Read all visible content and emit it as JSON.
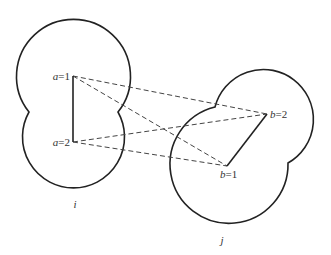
{
  "diagram": {
    "bodies": [
      {
        "id": "i",
        "label": "i",
        "sites": [
          {
            "var": "a",
            "value": "1",
            "text": "=1"
          },
          {
            "var": "a",
            "value": "2",
            "text": "=2"
          }
        ]
      },
      {
        "id": "j",
        "label": "j",
        "sites": [
          {
            "var": "b",
            "value": "1",
            "text": "=1"
          },
          {
            "var": "b",
            "value": "2",
            "text": "=2"
          }
        ]
      }
    ],
    "intramolecular_bonds": [
      {
        "from": "a=1",
        "to": "a=2",
        "style": "solid"
      },
      {
        "from": "b=1",
        "to": "b=2",
        "style": "solid"
      }
    ],
    "intermolecular_interactions": [
      {
        "from": "a=1",
        "to": "b=2",
        "style": "dashed"
      },
      {
        "from": "a=1",
        "to": "b=1",
        "style": "dashed"
      },
      {
        "from": "a=2",
        "to": "b=2",
        "style": "dashed"
      },
      {
        "from": "a=2",
        "to": "b=1",
        "style": "dashed"
      }
    ]
  }
}
